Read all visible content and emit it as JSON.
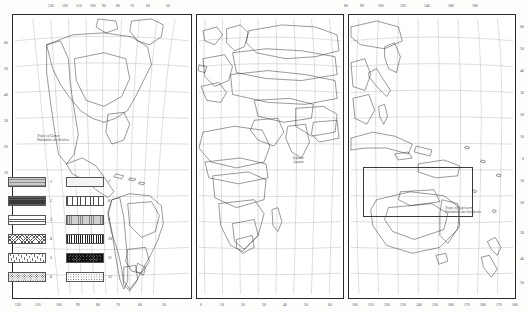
{
  "map": {
    "title": "World thematic map",
    "projection_note": "three-panel world map",
    "panels": [
      {
        "name": "americas-panel",
        "label": "Americas"
      },
      {
        "name": "eurasia-africa-panel",
        "label": "Eurasia and Africa"
      },
      {
        "name": "pacific-panel",
        "label": "Pacific and Australasia"
      }
    ],
    "annotations": [
      {
        "name": "tropic-of-cancer",
        "line1": "Tropic of Cancer",
        "line2": "Wendekreis des Krebses"
      },
      {
        "name": "equator",
        "line1": "Equator",
        "line2": "Äquator"
      },
      {
        "name": "tropic-of-capricorn",
        "line1": "Tropic of Capricorn",
        "line2": "Wendekreis des Steinbocks"
      }
    ],
    "longitude_top_left": [
      "130",
      "120",
      "110",
      "100",
      "90",
      "80",
      "70",
      "60",
      "50"
    ],
    "longitude_top_right": [
      "80",
      "90",
      "100",
      "120",
      "140",
      "160",
      "180"
    ],
    "longitude_bottom_left": [
      "120",
      "110",
      "100",
      "90",
      "80",
      "70",
      "60",
      "50"
    ],
    "longitude_bottom_mid": [
      "0",
      "10",
      "20",
      "30",
      "40",
      "50",
      "60"
    ],
    "longitude_bottom_right": [
      "100",
      "110",
      "120",
      "130",
      "140",
      "150",
      "160",
      "170",
      "180",
      "170",
      "160"
    ],
    "latitude_left": [
      "60",
      "50",
      "40",
      "30",
      "20",
      "10"
    ],
    "latitude_right": [
      "60",
      "50",
      "40",
      "30",
      "20",
      "10",
      "0",
      "10",
      "20",
      "30",
      "40",
      "50"
    ]
  },
  "legend": {
    "name": "map-legend",
    "columns": [
      {
        "name": "legend-column-left",
        "entries": [
          {
            "num": "1",
            "pattern": "f1",
            "desc": "grey horizontal ruling"
          },
          {
            "num": "2",
            "pattern": "f2",
            "desc": "solid dark"
          },
          {
            "num": "3",
            "pattern": "f3",
            "desc": "fine horizontal lines"
          },
          {
            "num": "4",
            "pattern": "f4",
            "desc": "cross lattice"
          },
          {
            "num": "5",
            "pattern": "f5",
            "desc": "steep diagonal hatch"
          },
          {
            "num": "6",
            "pattern": "f6",
            "desc": "coarse stipple dots"
          }
        ]
      },
      {
        "name": "legend-column-right",
        "entries": [
          {
            "num": "7",
            "pattern": "f7",
            "desc": "blank / pale tint"
          },
          {
            "num": "8",
            "pattern": "f8",
            "desc": "vertical ruling"
          },
          {
            "num": "9",
            "pattern": "f9",
            "desc": "grey vertical ruling"
          },
          {
            "num": "10",
            "pattern": "f10",
            "desc": "dense black vertical bars"
          },
          {
            "num": "11",
            "pattern": "f11",
            "desc": "dark chequer"
          },
          {
            "num": "12",
            "pattern": "f12",
            "desc": "fine stipple"
          }
        ]
      }
    ]
  }
}
